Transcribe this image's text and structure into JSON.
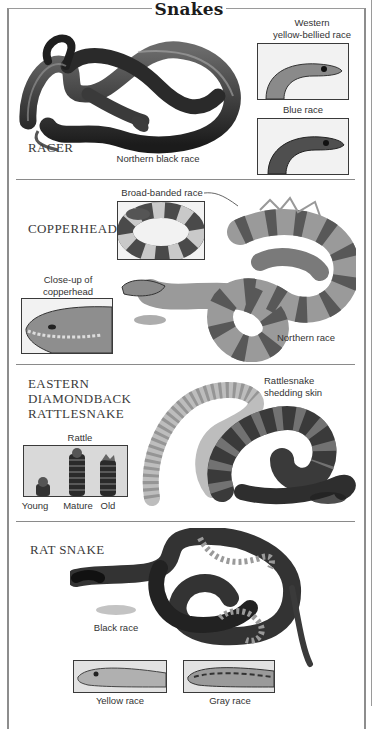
{
  "page": {
    "title": "Snakes"
  },
  "sections": {
    "racer": {
      "name": "RACER",
      "main_caption": "Northern black race",
      "inset_1_caption": "Western\nyellow-bellied race",
      "inset_1_line1": "Western",
      "inset_1_line2": "yellow-bellied race",
      "inset_2_caption": "Blue race"
    },
    "copperhead": {
      "name": "COPPERHEAD",
      "inset_1_caption": "Broad-banded race",
      "inset_2_line1": "Close-up of",
      "inset_2_line2": "copperhead",
      "main_caption": "Northern race"
    },
    "rattlesnake": {
      "name_line1": "EASTERN",
      "name_line2": "DIAMONDBACK",
      "name_line3": "RATTLESNAKE",
      "main_line1": "Rattlesnake",
      "main_line2": "shedding skin",
      "rattle_caption": "Rattle",
      "rattle_labels": [
        "Young",
        "Mature",
        "Old"
      ]
    },
    "rat_snake": {
      "name": "RAT SNAKE",
      "main_caption": "Black race",
      "inset_1_caption": "Yellow race",
      "inset_2_caption": "Gray race"
    }
  },
  "colors": {
    "border": "#8d8d8d",
    "ink": "#222222",
    "inset_border": "#3a3a3a"
  }
}
